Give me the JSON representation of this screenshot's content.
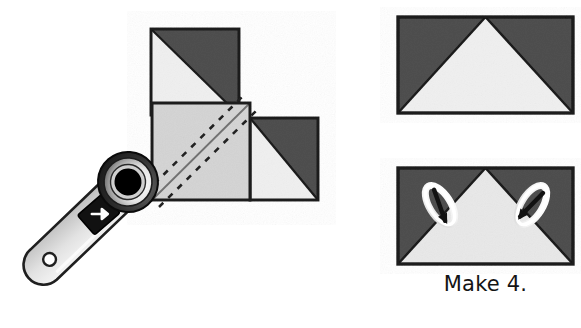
{
  "figure": {
    "kind": "quilting-instruction-diagram",
    "background_color": "#ffffff",
    "caption": "Make 4."
  },
  "palette": {
    "dark_fabric": "#4f4f4f",
    "light_fabric": "#f0f0f0",
    "medium_fabric": "#d5d5d5",
    "outline": "#1a1a1a",
    "stitch_line": "#6b6b6b",
    "tool_body": "#e0e0e0",
    "tool_body_shade": "#b9b9b9",
    "tool_switch": "#111111",
    "blade_hub": "#000000",
    "blade_ring_light": "#f7f7f7",
    "blade_ring_dark": "#2a2a2a",
    "pin_body": "#fbfbfb",
    "pin_needle": "#121212"
  },
  "left_assembly": {
    "name": "partially-sewn-square-in-a-square-unit",
    "squares": [
      {
        "name": "top-half-square-triangle",
        "x": 151,
        "y": 29,
        "w": 88,
        "h": 86,
        "light_corner": "bottom-left",
        "dark_corner": "top-right"
      },
      {
        "name": "center-marked-square",
        "x": 152,
        "y": 103,
        "w": 98,
        "h": 97,
        "fill": "medium",
        "marked": true,
        "marking": {
          "diagonal": "bottom-left-to-top-right",
          "solid_lines": 1,
          "dashed_lines": 2,
          "dashed_label": "sewing-lines"
        }
      },
      {
        "name": "right-half-square-triangle",
        "x": 250,
        "y": 118,
        "w": 68,
        "h": 82,
        "light_corner": "bottom-left",
        "dark_corner": "top-right"
      }
    ]
  },
  "rotary_cutter": {
    "name": "rotary-cutter-tool",
    "angle_degrees": -40,
    "parts": [
      {
        "name": "handle",
        "label": "handle"
      },
      {
        "name": "handle-hole",
        "label": "hanging hole"
      },
      {
        "name": "safety-switch",
        "label": "blade guard switch"
      },
      {
        "name": "switch-arrow-icon",
        "label": "arrow"
      },
      {
        "name": "blade-head",
        "label": "circular blade housing"
      },
      {
        "name": "blade-hub",
        "label": "hub"
      }
    ]
  },
  "right_column": {
    "units": [
      {
        "name": "flying-geese-unit-finished",
        "x": 398,
        "y": 17,
        "w": 175,
        "h": 96,
        "background": "dark",
        "triangle": "light",
        "triangle_direction": "up",
        "pins": 0
      },
      {
        "name": "flying-geese-unit-pinned",
        "x": 398,
        "y": 168,
        "w": 175,
        "h": 96,
        "background": "dark",
        "triangle": "light",
        "triangle_direction": "up",
        "pins": 2,
        "pin_positions": [
          "left-seam",
          "right-seam"
        ]
      }
    ]
  }
}
